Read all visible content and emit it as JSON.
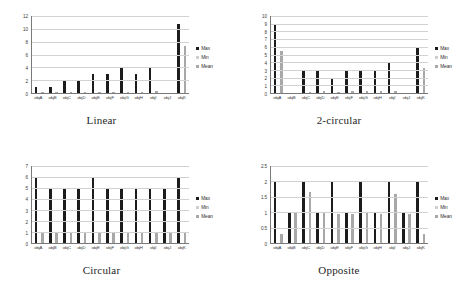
{
  "legend": {
    "entries": [
      {
        "label": "Max",
        "color": "#1c1c1c"
      },
      {
        "label": "Min",
        "color": "#cfcfcf"
      },
      {
        "label": "Mean",
        "color": "#a8a8a8"
      }
    ]
  },
  "categories": [
    "objA",
    "objB",
    "objC",
    "objD",
    "objE",
    "objF",
    "objG",
    "objH",
    "objI",
    "objJ",
    "objK"
  ],
  "panels": [
    {
      "title": "Linear",
      "key": "linear"
    },
    {
      "title": "2-circular",
      "key": "two_circular"
    },
    {
      "title": "Circular",
      "key": "circular"
    },
    {
      "title": "Opposite",
      "key": "opposite"
    }
  ],
  "chart_data": [
    {
      "type": "bar",
      "title": "Linear",
      "xlabel": "",
      "ylabel": "",
      "ylim": [
        0,
        12
      ],
      "yticks": [
        0,
        2,
        4,
        6,
        8,
        10,
        12
      ],
      "grid": true,
      "legend_position": "right",
      "categories": [
        "objA",
        "objB",
        "objC",
        "objD",
        "objE",
        "objF",
        "objG",
        "objH",
        "objI",
        "objJ",
        "objK"
      ],
      "series": [
        {
          "name": "Max",
          "values": [
            0.9,
            0.95,
            2.0,
            2.0,
            2.95,
            2.95,
            3.85,
            2.9,
            3.85,
            0,
            10.8
          ]
        },
        {
          "name": "Min",
          "values": [
            0,
            0,
            0,
            0,
            0,
            0,
            0,
            0,
            0,
            0,
            0
          ]
        },
        {
          "name": "Mean",
          "values": [
            0.2,
            0.15,
            0.1,
            0.1,
            0.1,
            0.1,
            0.12,
            0.1,
            0.25,
            0,
            7.35
          ]
        }
      ]
    },
    {
      "type": "bar",
      "title": "2-circular",
      "xlabel": "",
      "ylabel": "",
      "ylim": [
        0,
        10
      ],
      "yticks": [
        0,
        1,
        2,
        3,
        4,
        5,
        6,
        7,
        8,
        9,
        10
      ],
      "grid": true,
      "legend_position": "right",
      "categories": [
        "objA",
        "objB",
        "objC",
        "objD",
        "objE",
        "objF",
        "objG",
        "objH",
        "objI",
        "objJ",
        "objK"
      ],
      "series": [
        {
          "name": "Max",
          "values": [
            9.0,
            0,
            2.95,
            2.95,
            1.95,
            2.95,
            2.9,
            2.9,
            3.85,
            0,
            5.9
          ]
        },
        {
          "name": "Min",
          "values": [
            0,
            0,
            0,
            0,
            0,
            0,
            0,
            0,
            0,
            0,
            0
          ]
        },
        {
          "name": "Mean",
          "values": [
            5.4,
            0,
            0.1,
            0.25,
            0.12,
            0.22,
            0.2,
            0.3,
            0.22,
            0,
            3.3
          ]
        }
      ]
    },
    {
      "type": "bar",
      "title": "Circular",
      "xlabel": "",
      "ylabel": "",
      "ylim": [
        0,
        7
      ],
      "yticks": [
        0,
        1,
        2,
        3,
        4,
        5,
        6,
        7
      ],
      "grid": true,
      "legend_position": "right",
      "categories": [
        "objA",
        "objB",
        "objC",
        "objD",
        "objE",
        "objF",
        "objG",
        "objH",
        "objI",
        "objJ",
        "objK"
      ],
      "series": [
        {
          "name": "Max",
          "values": [
            6.0,
            5.0,
            5.0,
            5.0,
            6.0,
            5.0,
            5.0,
            4.95,
            4.95,
            4.9,
            5.9
          ]
        },
        {
          "name": "Min",
          "values": [
            0,
            0,
            0,
            0,
            0,
            0,
            0,
            0,
            0,
            0,
            0
          ]
        },
        {
          "name": "Mean",
          "values": [
            1.0,
            1.0,
            1.0,
            1.0,
            1.0,
            1.0,
            1.0,
            1.0,
            1.0,
            1.0,
            1.0
          ]
        }
      ]
    },
    {
      "type": "bar",
      "title": "Opposite",
      "xlabel": "",
      "ylabel": "",
      "ylim": [
        0,
        2.5
      ],
      "yticks": [
        0,
        0.5,
        1,
        1.5,
        2,
        2.5
      ],
      "ytick_labels": [
        "0",
        "0.5",
        "1",
        "1.5",
        "2",
        "2.5"
      ],
      "grid": true,
      "legend_position": "right",
      "categories": [
        "objA",
        "objB",
        "objC",
        "objD",
        "objE",
        "objF",
        "objG",
        "objH",
        "objI",
        "objJ",
        "objK"
      ],
      "series": [
        {
          "name": "Max",
          "values": [
            2.0,
            1.0,
            2.0,
            1.0,
            2.0,
            1.0,
            2.0,
            1.0,
            1.98,
            1.0,
            1.98
          ]
        },
        {
          "name": "Min",
          "values": [
            0,
            0,
            0,
            0,
            0,
            0,
            0,
            0,
            0,
            0,
            0
          ]
        },
        {
          "name": "Mean",
          "values": [
            0.3,
            1.0,
            1.65,
            1.0,
            0.95,
            0.95,
            1.02,
            0.95,
            1.6,
            0.95,
            0.3
          ]
        }
      ]
    }
  ]
}
